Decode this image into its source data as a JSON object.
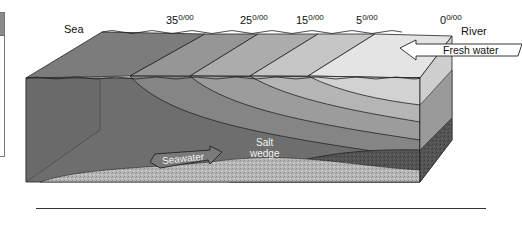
{
  "diagram": {
    "title_labels": {
      "sea": "Sea",
      "river": "River"
    },
    "salinity_labels": [
      {
        "value": "35",
        "unit": "0/00"
      },
      {
        "value": "25",
        "unit": "0/00"
      },
      {
        "value": "15",
        "unit": "0/00"
      },
      {
        "value": "5",
        "unit": "0/00"
      },
      {
        "value": "0",
        "unit": "0/00"
      }
    ],
    "arrows": {
      "fresh_water": "Fresh water",
      "seawater": "Seawater"
    },
    "annotations": {
      "salt_wedge_line1": "Salt",
      "salt_wedge_line2": "wedge"
    },
    "colors": {
      "deep_sea": "#6e6e6e",
      "zone_35": "#8c8c8c",
      "zone_25": "#a3a3a3",
      "zone_15": "#bdbdbd",
      "zone_5": "#d6d6d6",
      "zone_0": "#ececec",
      "sediment": "#b8b8b8",
      "dark_sediment": "#555555"
    }
  }
}
